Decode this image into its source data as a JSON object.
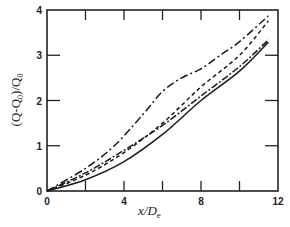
{
  "chart_data": {
    "type": "line",
    "title": "",
    "xlabel": "x/D_e",
    "ylabel": "(Q-Q_0)/Q_0",
    "xlim": [
      0,
      12
    ],
    "ylim": [
      0,
      4
    ],
    "xticks": [
      0,
      2,
      4,
      6,
      8,
      10,
      12
    ],
    "xtick_labels": [
      "0",
      "",
      "4",
      "",
      "8",
      "",
      "12"
    ],
    "yticks": [
      0,
      1,
      2,
      3,
      4
    ],
    "ytick_labels": [
      "0",
      "1",
      "2",
      "3",
      "4"
    ],
    "grid": false,
    "legend": null,
    "series": [
      {
        "name": "dash-dot",
        "style": "dashdot",
        "x": [
          0,
          2,
          3.5,
          5,
          6,
          7,
          8,
          9,
          10,
          11.5
        ],
        "y": [
          0,
          0.5,
          1.0,
          1.7,
          2.2,
          2.5,
          2.7,
          3.0,
          3.3,
          3.87
        ]
      },
      {
        "name": "short-dash",
        "style": "dashed",
        "x": [
          0,
          2,
          4,
          6,
          8,
          10,
          11.5
        ],
        "y": [
          0,
          0.35,
          0.85,
          1.5,
          2.3,
          3.0,
          3.76
        ]
      },
      {
        "name": "long-dash",
        "style": "longdash",
        "x": [
          0,
          2,
          4,
          6,
          8,
          10,
          11.5
        ],
        "y": [
          0,
          0.4,
          0.9,
          1.45,
          2.1,
          2.75,
          3.34
        ]
      },
      {
        "name": "solid",
        "style": "solid",
        "x": [
          0,
          2,
          4,
          6,
          8,
          10,
          11.5
        ],
        "y": [
          0,
          0.25,
          0.65,
          1.25,
          2.0,
          2.65,
          3.29
        ]
      }
    ]
  },
  "labels": {
    "x_axis_main": "x/D",
    "x_axis_sub": "e",
    "y_axis": "(Q-Q",
    "y_axis_sub0": "0",
    "y_axis_mid": ")/Q",
    "y_axis_sub1": "0"
  }
}
